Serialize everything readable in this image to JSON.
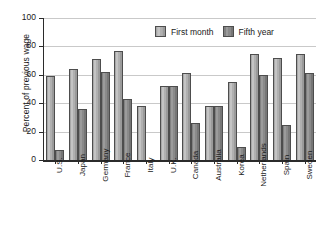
{
  "chart_data": {
    "type": "bar",
    "title": "",
    "xlabel": "",
    "ylabel": "Percent of previous wage",
    "ylim": [
      0,
      100
    ],
    "yticks": [
      0,
      20,
      40,
      60,
      80,
      100
    ],
    "ytick_labels": [
      "0",
      "20",
      "40",
      "60",
      "80",
      "100"
    ],
    "grid": true,
    "legend_position": "top-center",
    "categories": [
      "U.S.",
      "Japan",
      "Germany",
      "France",
      "Italy",
      "U.K.",
      "Canada",
      "Australia",
      "Korea",
      "Netherlands",
      "Spain",
      "Sweden"
    ],
    "series": [
      {
        "name": "First month",
        "color": "#b4b4b4",
        "values": [
          59,
          64,
          71,
          77,
          38,
          52,
          61,
          38,
          55,
          75,
          72,
          75
        ]
      },
      {
        "name": "Fifth year",
        "color": "#8a8a8a",
        "values": [
          7,
          36,
          62,
          43,
          0,
          52,
          26,
          38,
          9,
          60,
          25,
          61
        ]
      }
    ]
  }
}
